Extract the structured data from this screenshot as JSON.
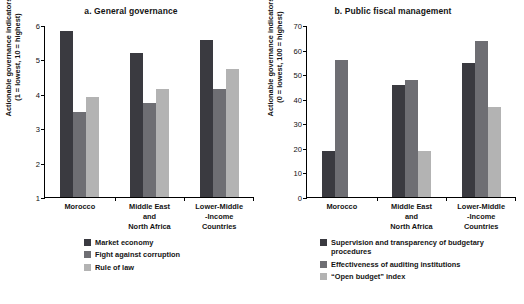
{
  "chart_data": [
    {
      "type": "bar",
      "panel": "a",
      "title": "a. General governance",
      "xlabel": "",
      "ylabel": "Actionable governance indicators",
      "ylabel_line2": "(1 = lowest, 10 = highest)",
      "categories": [
        "Morocco",
        "Middle East\nand\nNorth Africa",
        "Lower-Middle\n-Income\nCountries"
      ],
      "category_lines": [
        [
          "Morocco"
        ],
        [
          "Middle East",
          "and",
          "North Africa"
        ],
        [
          "Lower-Middle",
          "-Income",
          "Countries"
        ]
      ],
      "series": [
        {
          "name": "Market economy",
          "values": [
            5.85,
            5.2,
            5.6
          ],
          "color": "#3a3a40"
        },
        {
          "name": "Fight against corruption",
          "values": [
            3.5,
            3.75,
            4.17
          ],
          "color": "#6e6e73"
        },
        {
          "name": "Rule of law",
          "values": [
            3.92,
            4.17,
            4.75
          ],
          "color": "#b3b3b3"
        }
      ],
      "ylim": [
        1,
        6
      ],
      "yticks": [
        1,
        2,
        3,
        4,
        5,
        6
      ],
      "ytick_labels": [
        "1",
        "2",
        "3",
        "4",
        "5",
        "6"
      ],
      "grid": false,
      "legend_position": "bottom"
    },
    {
      "type": "bar",
      "panel": "b",
      "title": "b. Public fiscal management",
      "xlabel": "",
      "ylabel": "Actionable governance indicators",
      "ylabel_line2": "(0 = lowest, 100 = highest)",
      "categories": [
        "Morocco",
        "Middle East\nand\nNorth Africa",
        "Lower-Middle\n-Income\nCountries"
      ],
      "category_lines": [
        [
          "Morocco"
        ],
        [
          "Middle East",
          "and",
          "North Africa"
        ],
        [
          "Lower-Middle",
          "-Income",
          "Countries"
        ]
      ],
      "series": [
        {
          "name": "Supervision and transparency of budgetary procedures",
          "values": [
            19,
            46,
            55
          ],
          "color": "#3a3a40"
        },
        {
          "name": "Effectiveness of auditing institutions",
          "values": [
            56,
            48,
            64
          ],
          "color": "#6e6e73"
        },
        {
          "name": "“Open budget” index",
          "values": [
            null,
            19,
            37
          ],
          "color": "#b3b3b3"
        }
      ],
      "ylim": [
        0,
        70
      ],
      "yticks": [
        0,
        10,
        20,
        30,
        40,
        50,
        60,
        70
      ],
      "ytick_labels": [
        "0",
        "10",
        "20",
        "30",
        "40",
        "50",
        "60",
        "70"
      ],
      "grid": false,
      "legend_position": "bottom"
    }
  ]
}
